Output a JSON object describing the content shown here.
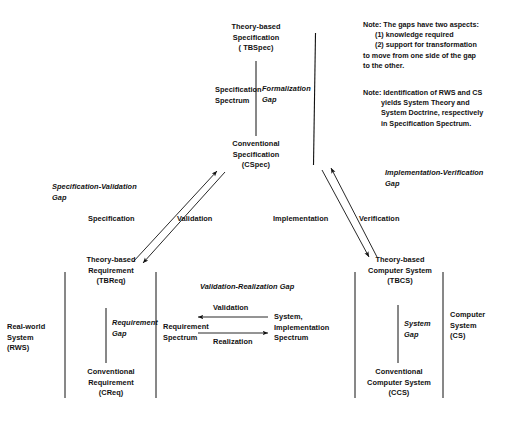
{
  "diagram": {
    "nodes": {
      "tbspec": "Theory-based\nSpecification\n( TBSpec)",
      "cspec": "Conventional\nSpecification\n(CSpec)",
      "spec_spectrum": "Specification\nSpectrum",
      "formalization_gap": "Formalization\nGap",
      "spec_validation_gap": "Specification-Validation\nGap",
      "specification": "Specification",
      "validation_diag": "Validation",
      "implementation": "Implementation",
      "verification": "Verification",
      "impl_verif_gap": "Implementation-Verification\nGap",
      "tbreq": "Theory-based\nRequirement\n(TBReq)",
      "creq": "Conventional\nRequirement\n(CReq)",
      "requirement_gap": "Requirement\nGap",
      "rws": "Real-world\nSystem\n(RWS)",
      "req_spectrum": "Requirement\nSpectrum",
      "val_real_gap": "Validation-Realization Gap",
      "validation_h": "Validation",
      "realization_h": "Realization",
      "sys_impl_spectrum": "System,\nImplementation\nSpectrum",
      "tbcs": "Theory-based\nComputer System\n(TBCS)",
      "ccs": "Conventional\nComputer System\n(CCS)",
      "system_gap": "System\nGap",
      "cs": "Computer\nSystem\n(CS)"
    },
    "notes": {
      "note1": "Note: The gaps have two aspects:\n      (1) knowledge required\n      (2) support for transformation\nto move from one side of the gap\nto the other.",
      "note2": "Note: Identification of RWS and CS\n         yields System Theory and\n         System Doctrine, respectively\n         in Specification Spectrum."
    },
    "colors": {
      "ink": "#111111",
      "background": "#ffffff"
    }
  }
}
